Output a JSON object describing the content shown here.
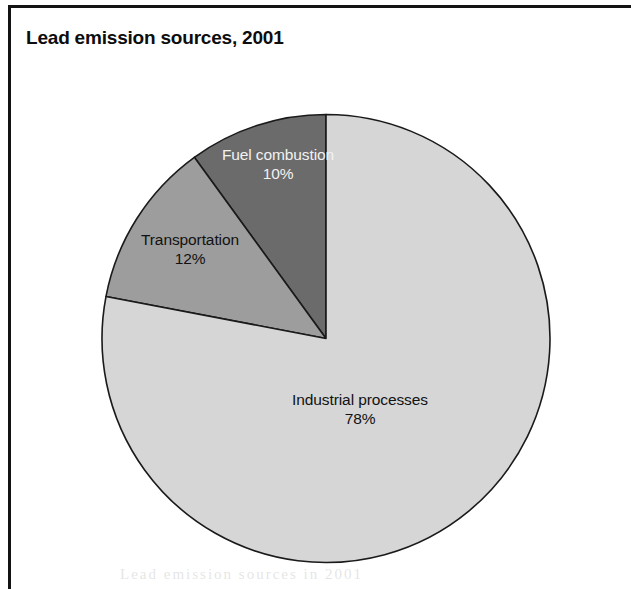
{
  "figure": {
    "title": "Lead emission sources, 2001",
    "frame_color": "#131313",
    "background": "#ffffff"
  },
  "chart_data": {
    "type": "pie",
    "title": "Lead emission sources, 2001",
    "xlabel": "",
    "ylabel": "",
    "units": "percent",
    "start_angle_deg": 90,
    "direction": "counterclockwise",
    "legend": "none (labels drawn on slices)",
    "grid": false,
    "categories": [
      "Fuel combustion",
      "Transportation",
      "Industrial processes"
    ],
    "values": [
      10,
      12,
      78
    ],
    "value_labels": [
      "10%",
      "12%",
      "78%"
    ],
    "colors": [
      "#6b6b6b",
      "#9d9d9d",
      "#d6d6d6"
    ],
    "label_colors": [
      "#f2f2f2",
      "#121212",
      "#121212"
    ],
    "slices": [
      {
        "name": "Fuel combustion",
        "value": 10,
        "value_label": "10%",
        "color": "#6b6b6b",
        "label_color": "#f2f2f2",
        "angle_deg": 36
      },
      {
        "name": "Transportation",
        "value": 12,
        "value_label": "12%",
        "color": "#9d9d9d",
        "label_color": "#121212",
        "angle_deg": 43.2
      },
      {
        "name": "Industrial processes",
        "value": 78,
        "value_label": "78%",
        "color": "#d6d6d6",
        "label_color": "#121212",
        "angle_deg": 280.8
      }
    ]
  },
  "bleed_text": "Lead  emission  sources  in  2001"
}
